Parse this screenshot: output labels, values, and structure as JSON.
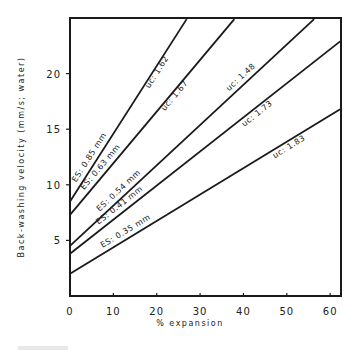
{
  "chart_data": {
    "type": "line",
    "title": "",
    "xlabel": "% expansion",
    "ylabel": "Back-washing velocity (mm/s; water)",
    "xlim": [
      0,
      62.5
    ],
    "ylim": [
      0,
      25
    ],
    "xticks": [
      0,
      10,
      20,
      30,
      40,
      50,
      60
    ],
    "yticks": [
      5,
      10,
      15,
      20
    ],
    "xtick_labels": [
      "0",
      "10",
      "20",
      "30",
      "40",
      "50",
      "60"
    ],
    "ytick_labels": [
      "5",
      "10",
      "15",
      "20"
    ],
    "grid": false,
    "legend": "none (inline labels along lines)",
    "series": [
      {
        "name": "ES: 0.85 mm",
        "es_label": "ES: 0.85 mm",
        "uc_label": "uc: 1.62",
        "x": [
          0,
          26.9
        ],
        "y": [
          8.5,
          24.9
        ]
      },
      {
        "name": "ES: 0.63 mm",
        "es_label": "ES: 0.63 mm",
        "uc_label": "uc: 1.67",
        "x": [
          0,
          37.9
        ],
        "y": [
          7.3,
          24.9
        ]
      },
      {
        "name": "ES: 0.54 mm",
        "es_label": "ES: 0.54 mm",
        "uc_label": "uc: 1.48",
        "x": [
          0,
          56.3
        ],
        "y": [
          4.5,
          24.9
        ]
      },
      {
        "name": "ES: 0.41 mm",
        "es_label": "ES: 0.41 mm",
        "uc_label": "uc: 1.73",
        "x": [
          0,
          62.3
        ],
        "y": [
          3.8,
          22.9
        ]
      },
      {
        "name": "ES: 0.35 mm",
        "es_label": "ES: 0.35 mm",
        "uc_label": "uc: 1.83",
        "x": [
          0,
          62.3
        ],
        "y": [
          2.0,
          16.8
        ]
      }
    ]
  },
  "colors": {
    "ink": "#1a1a1a",
    "background": "#ffffff"
  }
}
